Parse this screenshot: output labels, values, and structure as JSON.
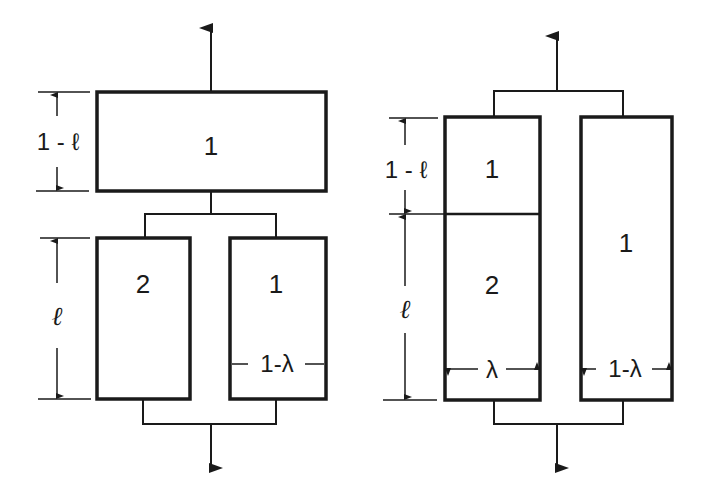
{
  "diagram": {
    "left": {
      "top_box_label": "1",
      "bottom_left_box_label": "2",
      "bottom_right_box_label": "1",
      "dim_top": "1 - ℓ",
      "dim_bottom": "ℓ",
      "dim_width_right": "1-λ"
    },
    "right": {
      "left_upper_label": "1",
      "left_lower_label": "2",
      "right_box_label": "1",
      "dim_top": "1 - ℓ",
      "dim_bottom": "ℓ",
      "dim_width_left": "λ",
      "dim_width_right": "1-λ"
    },
    "colors": {
      "stroke": "#1a1a1a",
      "background": "#ffffff"
    }
  }
}
